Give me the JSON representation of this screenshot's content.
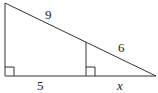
{
  "diagram": {
    "labels": {
      "hyp_upper": "9",
      "hyp_lower": "6",
      "base_left": "5",
      "base_right": "x"
    },
    "colors": {
      "stroke": "#333333",
      "background": "#ffffff"
    }
  }
}
